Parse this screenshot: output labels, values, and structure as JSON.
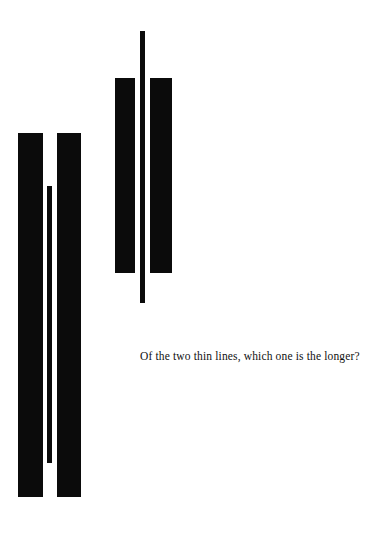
{
  "page": {
    "background_color": "#ffffff",
    "ink_color": "#0b0b0b",
    "width": 388,
    "height": 534
  },
  "figure": {
    "kind": "optical-illusion-figure",
    "caption_text": "Of the two thin lines, which one is the longer?",
    "caption_line_1": "Of the two thin lines, which one is",
    "caption_line_2": "the longer?",
    "groups": [
      {
        "id": "lower-left",
        "name": "lower-left-group",
        "bar_left_label": "thick bar left",
        "bar_right_label": "thick bar right",
        "thin_line_label": "thin line"
      },
      {
        "id": "upper-right",
        "name": "upper-right-group",
        "bar_left_label": "thick bar left",
        "bar_right_label": "thick bar right",
        "thin_line_label": "thin line"
      }
    ]
  },
  "chart_data": {
    "type": "bar",
    "title": "Of the two thin lines, which one is the longer?",
    "subtitle": "",
    "xlabel": "",
    "ylabel": "",
    "orientation": "vertical",
    "grid": false,
    "legend": null,
    "axis_ranges": {
      "x": [
        0,
        388
      ],
      "y": [
        0,
        534
      ]
    },
    "note": "Vertical black rectangles on white. Coordinates are pixel positions measured from the top-left of the 388x534 image. The two thin lines are nearly equal in drawn length; the flanking thick bars differ in length to create the illusion.",
    "categories": [
      "lower-left bar-left",
      "lower-left thin-line",
      "lower-left bar-right",
      "upper-right bar-left",
      "upper-right thin-line",
      "upper-right bar-right"
    ],
    "values": [
      364,
      277,
      364,
      195,
      272,
      195
    ],
    "series": [
      {
        "name": "element length (px)",
        "values": [
          364,
          277,
          364,
          195,
          272,
          195
        ]
      },
      {
        "name": "element width (px)",
        "values": [
          25,
          5,
          24,
          20,
          5,
          22
        ]
      },
      {
        "name": "left edge x (px)",
        "values": [
          18,
          47,
          57,
          115,
          140,
          150
        ]
      },
      {
        "name": "top edge y (px)",
        "values": [
          133,
          186,
          133,
          78,
          31,
          78
        ]
      },
      {
        "name": "bottom edge y (px)",
        "values": [
          497,
          463,
          497,
          273,
          303,
          273
        ]
      }
    ]
  }
}
